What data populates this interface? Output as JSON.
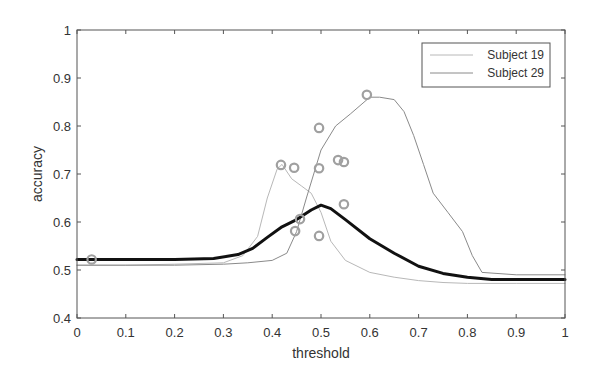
{
  "chart_data": {
    "type": "line",
    "title": "",
    "xlabel": "threshold",
    "ylabel": "accuracy",
    "xlim": [
      0,
      1
    ],
    "ylim": [
      0.4,
      1
    ],
    "xticks": [
      0,
      0.1,
      0.2,
      0.3,
      0.4,
      0.5,
      0.6,
      0.7,
      0.8,
      0.9,
      1
    ],
    "xtick_labels": [
      "0",
      "0.1",
      "0.2",
      "0.3",
      "0.4",
      "0.5",
      "0.6",
      "0.7",
      "0.8",
      "0.9",
      "1"
    ],
    "yticks": [
      0.4,
      0.5,
      0.6,
      0.7,
      0.8,
      0.9,
      1
    ],
    "ytick_labels": [
      "0.4",
      "0.5",
      "0.6",
      "0.7",
      "0.8",
      "0.9",
      "1"
    ],
    "grid": false,
    "legend_position": "upper right",
    "legend": [
      "Subject 19",
      "Subject 29"
    ],
    "series": [
      {
        "name": "Subject 19",
        "style": "thin-light",
        "color": "#b8b8b8",
        "x": [
          0,
          0.1,
          0.2,
          0.3,
          0.34,
          0.37,
          0.39,
          0.41,
          0.42,
          0.44,
          0.46,
          0.48,
          0.5,
          0.52,
          0.55,
          0.6,
          0.65,
          0.7,
          0.75,
          0.8,
          0.9,
          1
        ],
        "y": [
          0.51,
          0.51,
          0.512,
          0.515,
          0.53,
          0.57,
          0.65,
          0.71,
          0.72,
          0.69,
          0.675,
          0.66,
          0.62,
          0.56,
          0.52,
          0.495,
          0.485,
          0.478,
          0.474,
          0.472,
          0.472,
          0.472
        ]
      },
      {
        "name": "Subject 29",
        "style": "thin-dark",
        "color": "#8a8a8a",
        "x": [
          0,
          0.1,
          0.2,
          0.3,
          0.35,
          0.4,
          0.43,
          0.45,
          0.47,
          0.5,
          0.53,
          0.56,
          0.6,
          0.62,
          0.65,
          0.67,
          0.69,
          0.71,
          0.73,
          0.76,
          0.79,
          0.81,
          0.83,
          0.9,
          1
        ],
        "y": [
          0.51,
          0.51,
          0.51,
          0.512,
          0.515,
          0.52,
          0.535,
          0.58,
          0.65,
          0.75,
          0.8,
          0.825,
          0.86,
          0.86,
          0.855,
          0.83,
          0.78,
          0.72,
          0.66,
          0.62,
          0.58,
          0.53,
          0.495,
          0.49,
          0.49
        ]
      },
      {
        "name": "Mean",
        "style": "thick-black",
        "color": "#111111",
        "x": [
          0,
          0.1,
          0.2,
          0.28,
          0.33,
          0.36,
          0.39,
          0.42,
          0.45,
          0.48,
          0.5,
          0.52,
          0.55,
          0.6,
          0.65,
          0.7,
          0.75,
          0.8,
          0.85,
          0.9,
          1
        ],
        "y": [
          0.522,
          0.522,
          0.522,
          0.524,
          0.532,
          0.545,
          0.568,
          0.59,
          0.605,
          0.625,
          0.635,
          0.628,
          0.605,
          0.565,
          0.535,
          0.508,
          0.493,
          0.485,
          0.48,
          0.48,
          0.48
        ]
      }
    ],
    "scatter": {
      "name": "points",
      "marker": "open-circle",
      "color": "#a0a0a0",
      "points": [
        [
          0.03,
          0.522
        ],
        [
          0.418,
          0.719
        ],
        [
          0.445,
          0.713
        ],
        [
          0.447,
          0.581
        ],
        [
          0.457,
          0.606
        ],
        [
          0.496,
          0.796
        ],
        [
          0.496,
          0.712
        ],
        [
          0.496,
          0.571
        ],
        [
          0.535,
          0.729
        ],
        [
          0.547,
          0.725
        ],
        [
          0.547,
          0.637
        ],
        [
          0.594,
          0.865
        ]
      ]
    }
  }
}
